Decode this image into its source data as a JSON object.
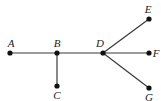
{
  "graph": {
    "type": "tree",
    "nodes": [
      {
        "id": "A",
        "label": "A",
        "x": 10,
        "y": 53,
        "lx": 11,
        "ly": 47
      },
      {
        "id": "B",
        "label": "B",
        "x": 57,
        "y": 53,
        "lx": 57,
        "ly": 47
      },
      {
        "id": "C",
        "label": "C",
        "x": 57,
        "y": 86,
        "lx": 57,
        "ly": 99
      },
      {
        "id": "D",
        "label": "D",
        "x": 103,
        "y": 53,
        "lx": 100,
        "ly": 47
      },
      {
        "id": "E",
        "label": "E",
        "x": 149,
        "y": 19,
        "lx": 148,
        "ly": 13
      },
      {
        "id": "F",
        "label": "F",
        "x": 149,
        "y": 53,
        "lx": 156,
        "ly": 57
      },
      {
        "id": "G",
        "label": "G",
        "x": 149,
        "y": 88,
        "lx": 149,
        "ly": 101
      }
    ],
    "edges": [
      [
        "A",
        "B"
      ],
      [
        "B",
        "C"
      ],
      [
        "B",
        "D"
      ],
      [
        "D",
        "E"
      ],
      [
        "D",
        "F"
      ],
      [
        "D",
        "G"
      ]
    ]
  }
}
